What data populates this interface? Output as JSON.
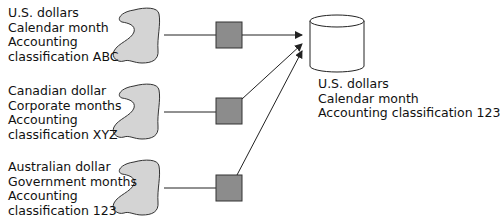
{
  "diagram": {
    "sources": [
      {
        "lines": [
          "U.S. dollars",
          "Calendar month",
          "Accounting",
          "classification ABC"
        ],
        "currency": "U.S. dollars",
        "calendar": "Calendar month",
        "classification": "Accounting classification ABC"
      },
      {
        "lines": [
          "Canadian dollar",
          "Corporate months",
          "Accounting",
          "classification XYZ"
        ],
        "currency": "Canadian dollar",
        "calendar": "Corporate months",
        "classification": "Accounting classification XYZ"
      },
      {
        "lines": [
          "Australian dollar",
          "Government months",
          "Accounting",
          "classification 123"
        ],
        "currency": "Australian dollar",
        "calendar": "Government months",
        "classification": "Accounting classification 123"
      }
    ],
    "target": {
      "shape": "database-cylinder",
      "lines": [
        "U.S. dollars",
        "Calendar month",
        "Accounting classification 123"
      ]
    },
    "transform_node": {
      "shape": "square",
      "count": 3
    },
    "colors": {
      "blob_fill": "#d4d4d4",
      "blob_stroke": "#333333",
      "box_fill": "#8c8c8c",
      "box_stroke": "#333333",
      "line": "#222222",
      "cylinder_fill": "#ffffff"
    }
  }
}
